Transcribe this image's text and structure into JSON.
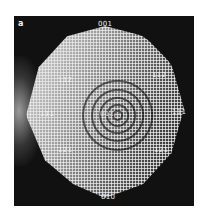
{
  "figure": {
    "panel_label": "a",
    "labels": [
      {
        "id": "top",
        "text": "001"
      },
      {
        "id": "upper-left",
        "text": "112"
      },
      {
        "id": "upper-right",
        "text": "112"
      },
      {
        "id": "left",
        "text": "111"
      },
      {
        "id": "center",
        "text": "011"
      },
      {
        "id": "right",
        "text": "111"
      },
      {
        "id": "lower-left",
        "text": "121"
      },
      {
        "id": "lower-right",
        "text": "121"
      },
      {
        "id": "bottom",
        "text": "010"
      }
    ]
  }
}
